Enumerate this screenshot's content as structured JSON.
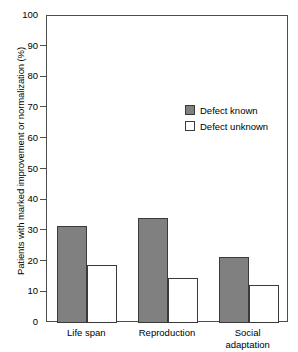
{
  "chart_data": {
    "type": "bar",
    "title": "",
    "xlabel": "",
    "ylabel": "Patients with marked improvement or normalization (%)",
    "ylim": [
      0,
      100
    ],
    "ytick_step": 10,
    "yticks": [
      "100",
      "90",
      "80",
      "70",
      "60",
      "50",
      "40",
      "30",
      "20",
      "10",
      "0"
    ],
    "grid": false,
    "legend_position": "upper-right-inside",
    "categories": [
      "Life span",
      "Reproduction",
      "Social\nadaptation"
    ],
    "series": [
      {
        "name": "Defect known",
        "values": [
          31.5,
          34.2,
          21.5
        ],
        "color": "#808080"
      },
      {
        "name": "Defect unknown",
        "values": [
          19.0,
          14.5,
          12.5
        ],
        "color": "#ffffff"
      }
    ]
  },
  "legend": {
    "items": [
      {
        "label": "Defect known"
      },
      {
        "label": "Defect unknown"
      }
    ]
  },
  "colors": {
    "known_fill": "#808080",
    "unknown_fill": "#ffffff",
    "bar_edge": "#3a3a3a",
    "axis": "#4d4d4d",
    "background": "#ffffff",
    "text": "#000000"
  }
}
